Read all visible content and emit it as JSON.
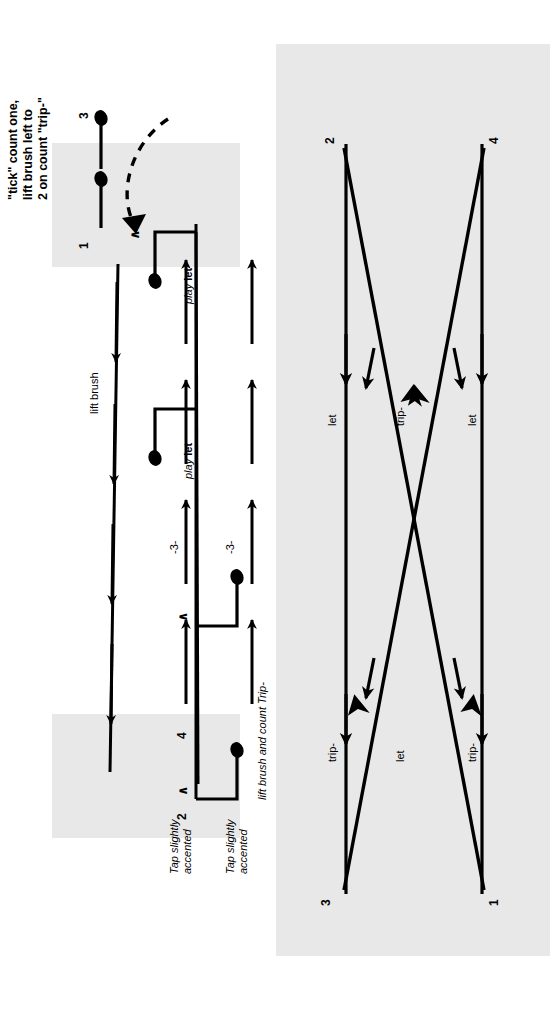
{
  "figure": {
    "orientation": "rotated-90-ccw",
    "background": "#ffffff",
    "highlight_color": "#e8e8e8",
    "ink_color": "#000000"
  },
  "diagram_top": {
    "name": "brush-stroke-pattern-diagram",
    "instruction_note": "\"tick\" count one,\nlift brush left to\n2 on count \"trip-\"",
    "beat_numbers": {
      "one": "1",
      "two": "2",
      "three": "3",
      "four": "4"
    },
    "accent_marks": [
      "∧",
      "∧",
      "∧"
    ],
    "labels": {
      "lift_brush": "lift brush",
      "triplet_upper": "-3-",
      "triplet_lower": "-3-",
      "play_let_upper": {
        "play": "play",
        "let": "let"
      },
      "play_let_lower": {
        "play": "play",
        "let": "let"
      },
      "tap_accented_upper": "Tap slightly\naccented",
      "tap_accented_lower": "Tap slightly\naccented",
      "lift_and_count": "lift brush and count Trip-"
    }
  },
  "diagram_bottom": {
    "name": "brush-sweep-path-diagram",
    "endpoint_numbers": [
      "1",
      "2",
      "3",
      "4"
    ],
    "syllable_labels": [
      "trip-",
      "let",
      "trip-",
      "let",
      "trip-",
      "let"
    ],
    "columns": [
      {
        "label": "trip-",
        "position": "left-outer"
      },
      {
        "label": "let",
        "position": "left-inner"
      },
      {
        "label": "trip-",
        "position": "center-left"
      },
      {
        "label": "let",
        "position": "center-right"
      },
      {
        "label": "trip-",
        "position": "right-inner"
      },
      {
        "label": "let",
        "position": "right-outer"
      }
    ]
  }
}
